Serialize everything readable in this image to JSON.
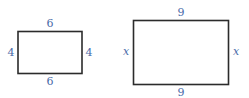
{
  "diagram": {
    "colors": {
      "stroke": "#2b2b2b",
      "label": "#4a6aa8"
    },
    "rectangles": [
      {
        "name": "small-rectangle",
        "top": "6",
        "bottom": "6",
        "left": "4",
        "right": "4"
      },
      {
        "name": "large-rectangle",
        "top": "9",
        "bottom": "9",
        "left": "x",
        "right": "x"
      }
    ]
  }
}
